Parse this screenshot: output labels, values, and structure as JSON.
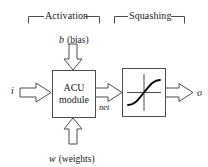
{
  "diagram": {
    "type": "block-diagram",
    "title_brackets": [
      {
        "name": "activation",
        "label": "Activation"
      },
      {
        "name": "squashing",
        "label": "Squashing"
      }
    ],
    "blocks": [
      {
        "name": "acu-module",
        "line1": "ACU",
        "line2": "module"
      },
      {
        "name": "squashing-function",
        "label": ""
      }
    ],
    "signals": {
      "input": {
        "symbol": "i",
        "name": "input"
      },
      "bias": {
        "symbol": "b",
        "paren": "(bias)"
      },
      "weights": {
        "symbol": "w",
        "paren": "(weights)"
      },
      "net": {
        "symbol": "net"
      },
      "output": {
        "symbol": "o",
        "name": "output"
      }
    },
    "colors": {
      "stroke": "#4d4d4d",
      "curve": "#000000",
      "text": "#1a1a1a",
      "background": "#ffffff"
    }
  }
}
